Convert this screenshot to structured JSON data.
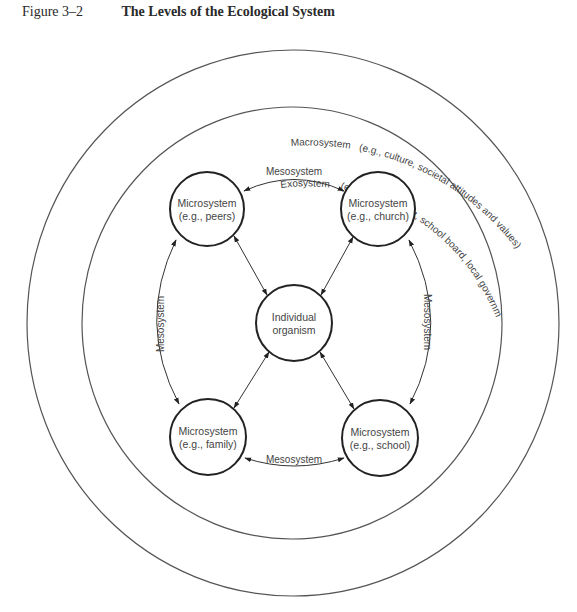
{
  "figure": {
    "number": "Figure 3–2",
    "title": "The Levels of the Ecological System"
  },
  "rings": {
    "macrosystem": {
      "label": "Macrosystem",
      "examples": "(e.g., culture, societal attitudes and values)"
    },
    "exosystem": {
      "label": "Exosystem",
      "examples": "(e.g., employment, school board, local government)"
    }
  },
  "nodes": {
    "center": {
      "line1": "Individual",
      "line2": "organism"
    },
    "peers": {
      "line1": "Microsystem",
      "line2": "(e.g., peers)"
    },
    "church": {
      "line1": "Microsystem",
      "line2": "(e.g., church)"
    },
    "family": {
      "line1": "Microsystem",
      "line2": "(e.g., family)"
    },
    "school": {
      "line1": "Microsystem",
      "line2": "(e.g., school)"
    }
  },
  "mesosystem_links": {
    "top": "Mesosystem",
    "bottom": "Mesosystem",
    "left": "Mesosystem",
    "right": "Mesosystem"
  },
  "colors": {
    "line": "#333333",
    "text": "#444444",
    "background": "#ffffff"
  }
}
